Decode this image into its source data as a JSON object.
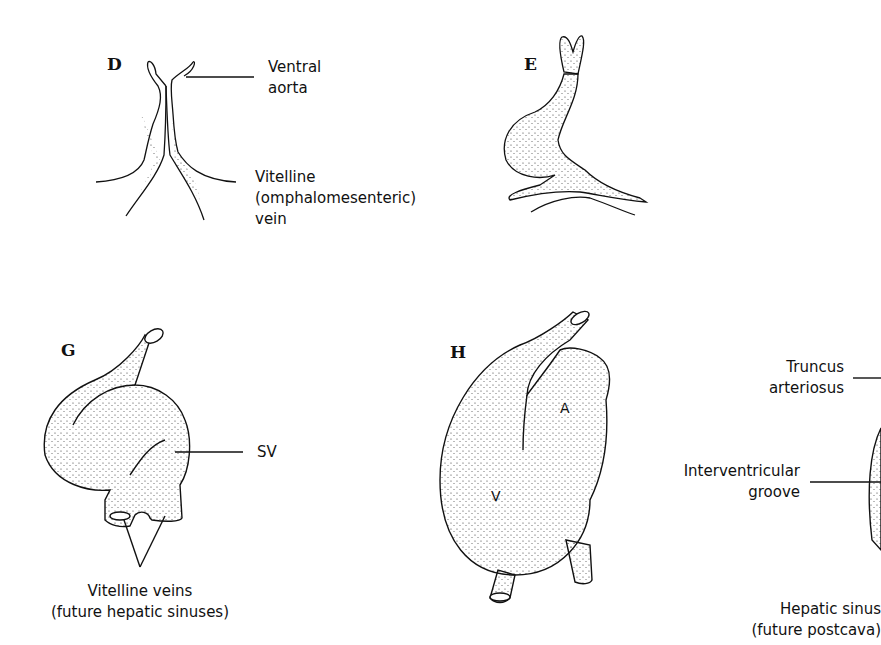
{
  "panels": {
    "D": {
      "letter": "D",
      "labels": {
        "ventral_aorta_1": "Ventral",
        "ventral_aorta_2": "aorta",
        "vitelline_1": "Vitelline",
        "vitelline_2": "(omphalomesenteric)",
        "vitelline_3": "vein"
      }
    },
    "E": {
      "letter": "E"
    },
    "G": {
      "letter": "G",
      "labels": {
        "sv": "SV",
        "vitelline_veins_1": "Vitelline veins",
        "vitelline_veins_2": "(future hepatic sinuses)"
      }
    },
    "H": {
      "letter": "H",
      "labels": {
        "atrium": "A",
        "ventricle": "V"
      }
    },
    "I_partial": {
      "labels": {
        "truncus_1": "Truncus",
        "truncus_2": "arteriosus",
        "interventricular_1": "Interventricular",
        "interventricular_2": "groove",
        "hepatic_1": "Hepatic sinus",
        "hepatic_2": "(future postcava)"
      }
    }
  },
  "colors": {
    "ink": "#111111",
    "background": "#ffffff"
  }
}
